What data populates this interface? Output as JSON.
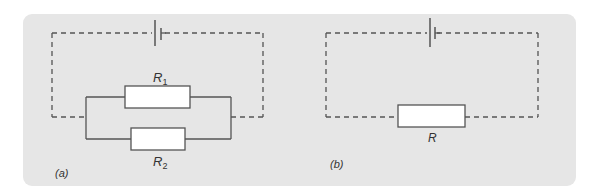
{
  "figure": {
    "background_panel_color": "#e6e6e6",
    "line_color": "#555555",
    "resistor_fill": "#ffffff",
    "circuit_a": {
      "caption": "(a)",
      "components": {
        "battery": "cell",
        "resistor_1": {
          "symbol": "R",
          "subscript": "1"
        },
        "resistor_2": {
          "symbol": "R",
          "subscript": "2"
        }
      },
      "arrangement": "R1 and R2 in parallel, connected to cell by dashed wires"
    },
    "circuit_b": {
      "caption": "(b)",
      "components": {
        "battery": "cell",
        "resistor": {
          "symbol": "R"
        }
      },
      "arrangement": "single equivalent resistor R connected to cell by dashed wires"
    }
  }
}
